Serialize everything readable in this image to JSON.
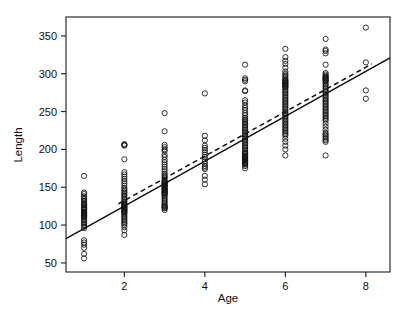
{
  "chart_data": {
    "type": "scatter",
    "title": "",
    "xlabel": "Age",
    "ylabel": "Length",
    "xlim": [
      0.55,
      8.6
    ],
    "ylim": [
      38,
      375
    ],
    "grid": false,
    "legend": "none",
    "xticks": [
      2,
      4,
      6,
      8
    ],
    "yticks": [
      50,
      100,
      150,
      200,
      250,
      300,
      350
    ],
    "xtick_labels": [
      "2",
      "4",
      "6",
      "8"
    ],
    "ytick_labels": [
      "50",
      "100",
      "150",
      "200",
      "250",
      "300",
      "350"
    ],
    "marker": "open-circle",
    "series": [
      {
        "name": "observations",
        "x": [
          1,
          1,
          1,
          1,
          1,
          1,
          1,
          1,
          1,
          1,
          1,
          1,
          1,
          1,
          1,
          1,
          1,
          1,
          1,
          1,
          1,
          1,
          1,
          1,
          1,
          1,
          1,
          1,
          1,
          1,
          1,
          1,
          1,
          1,
          1,
          1,
          1,
          1,
          2,
          2,
          2,
          2,
          2,
          2,
          2,
          2,
          2,
          2,
          2,
          2,
          2,
          2,
          2,
          2,
          2,
          2,
          2,
          2,
          2,
          2,
          2,
          2,
          2,
          2,
          2,
          2,
          2,
          2,
          2,
          2,
          2,
          2,
          2,
          2,
          2,
          2,
          2,
          2,
          2,
          2,
          2,
          2,
          2,
          2,
          3,
          3,
          3,
          3,
          3,
          3,
          3,
          3,
          3,
          3,
          3,
          3,
          3,
          3,
          3,
          3,
          3,
          3,
          3,
          3,
          3,
          3,
          3,
          3,
          3,
          3,
          3,
          3,
          3,
          3,
          3,
          3,
          3,
          3,
          3,
          3,
          3,
          3,
          3,
          3,
          3,
          3,
          3,
          3,
          3,
          3,
          3,
          3,
          3,
          3,
          4,
          4,
          4,
          4,
          4,
          4,
          4,
          4,
          4,
          4,
          4,
          4,
          4,
          4,
          4,
          4,
          4,
          4,
          5,
          5,
          5,
          5,
          5,
          5,
          5,
          5,
          5,
          5,
          5,
          5,
          5,
          5,
          5,
          5,
          5,
          5,
          5,
          5,
          5,
          5,
          5,
          5,
          5,
          5,
          5,
          5,
          5,
          5,
          5,
          5,
          5,
          5,
          5,
          5,
          5,
          5,
          5,
          5,
          5,
          5,
          5,
          5,
          5,
          5,
          5,
          5,
          5,
          5,
          5,
          5,
          5,
          5,
          6,
          6,
          6,
          6,
          6,
          6,
          6,
          6,
          6,
          6,
          6,
          6,
          6,
          6,
          6,
          6,
          6,
          6,
          6,
          6,
          6,
          6,
          6,
          6,
          6,
          6,
          6,
          6,
          6,
          6,
          6,
          6,
          6,
          6,
          6,
          6,
          6,
          6,
          6,
          6,
          6,
          6,
          6,
          6,
          6,
          6,
          6,
          6,
          6,
          6,
          6,
          6,
          6,
          6,
          6,
          6,
          6,
          6,
          7,
          7,
          7,
          7,
          7,
          7,
          7,
          7,
          7,
          7,
          7,
          7,
          7,
          7,
          7,
          7,
          7,
          7,
          7,
          7,
          7,
          7,
          7,
          7,
          7,
          7,
          7,
          7,
          7,
          7,
          7,
          7,
          7,
          7,
          7,
          7,
          7,
          7,
          7,
          7,
          7,
          7,
          7,
          7,
          7,
          7,
          7,
          7,
          7,
          7,
          7,
          7,
          8,
          8,
          8,
          8
        ],
        "y": [
          165,
          143,
          141,
          138,
          136,
          134,
          132,
          130,
          128,
          127,
          126,
          124,
          123,
          122,
          121,
          120,
          118,
          117,
          116,
          115,
          114,
          113,
          112,
          111,
          110,
          108,
          106,
          104,
          102,
          100,
          98,
          96,
          80,
          77,
          74,
          70,
          62,
          56,
          207,
          206,
          205,
          187,
          170,
          167,
          164,
          161,
          158,
          155,
          152,
          149,
          147,
          145,
          143,
          141,
          139,
          137,
          135,
          133,
          131,
          129,
          128,
          127,
          126,
          125,
          124,
          123,
          122,
          121,
          120,
          119,
          118,
          117,
          116,
          114,
          112,
          110,
          108,
          106,
          104,
          102,
          100,
          97,
          93,
          87,
          248,
          224,
          206,
          203,
          200,
          198,
          193,
          190,
          186,
          183,
          180,
          177,
          174,
          171,
          168,
          166,
          164,
          162,
          160,
          158,
          157,
          156,
          155,
          154,
          153,
          152,
          151,
          150,
          149,
          148,
          147,
          146,
          145,
          144,
          143,
          142,
          141,
          140,
          138,
          136,
          134,
          132,
          130,
          128,
          126,
          125,
          124,
          123,
          122,
          120,
          274,
          218,
          212,
          205,
          202,
          199,
          196,
          193,
          190,
          187,
          184,
          181,
          178,
          176,
          174,
          165,
          160,
          154,
          312,
          294,
          292,
          290,
          278,
          277,
          265,
          262,
          258,
          255,
          252,
          248,
          245,
          242,
          240,
          238,
          236,
          234,
          232,
          230,
          228,
          226,
          224,
          222,
          220,
          218,
          216,
          214,
          212,
          210,
          208,
          206,
          204,
          202,
          200,
          198,
          196,
          195,
          194,
          192,
          191,
          190,
          189,
          188,
          187,
          186,
          185,
          184,
          183,
          182,
          181,
          180,
          178,
          175,
          333,
          322,
          317,
          313,
          308,
          303,
          300,
          298,
          296,
          294,
          292,
          291,
          290,
          289,
          288,
          287,
          286,
          285,
          284,
          283,
          282,
          280,
          278,
          276,
          274,
          272,
          270,
          268,
          266,
          264,
          262,
          260,
          258,
          256,
          254,
          252,
          250,
          248,
          246,
          244,
          242,
          240,
          238,
          236,
          234,
          232,
          230,
          228,
          226,
          224,
          222,
          220,
          218,
          214,
          210,
          205,
          200,
          192,
          346,
          332,
          330,
          327,
          312,
          301,
          299,
          297,
          296,
          295,
          294,
          293,
          292,
          291,
          290,
          288,
          286,
          284,
          282,
          280,
          278,
          276,
          274,
          272,
          270,
          268,
          266,
          264,
          262,
          260,
          258,
          256,
          254,
          252,
          250,
          248,
          246,
          244,
          242,
          240,
          238,
          234,
          230,
          226,
          222,
          220,
          218,
          216,
          214,
          212,
          210,
          192,
          361,
          315,
          278,
          267
        ]
      }
    ],
    "lines": [
      {
        "name": "solid-fit-line",
        "style": "solid",
        "x": [
          0.55,
          8.6
        ],
        "y": [
          82,
          321
        ]
      },
      {
        "name": "dashed-fit-line",
        "style": "dashed",
        "x": [
          1.85,
          8.15
        ],
        "y": [
          128,
          313
        ]
      }
    ]
  }
}
